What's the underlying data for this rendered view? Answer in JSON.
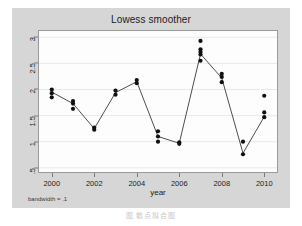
{
  "figure": {
    "note": "bandwidth = .1",
    "caption": "图          散点拟合图"
  },
  "chart_data": {
    "type": "scatter",
    "title": "Lowess smoother",
    "xlabel": "year",
    "ylabel": "",
    "xlim": [
      1999.4,
      2010.6
    ],
    "ylim": [
      0.42,
      3.12
    ],
    "grid": "horizontal",
    "legend": "none",
    "xticks": [
      2000,
      2002,
      2004,
      2006,
      2008,
      2010
    ],
    "xticklabels": [
      "2000",
      "2002",
      "2004",
      "2006",
      "2008",
      "2010"
    ],
    "yticks": [
      0.5,
      1,
      1.5,
      2,
      2.5,
      3
    ],
    "yticklabels": [
      ".5",
      "1",
      "1.5",
      "2",
      "2.5",
      "3"
    ],
    "marker": "filled-circle",
    "marker_color": "#101010",
    "line_color": "#3a3a3a",
    "plot_bg": "#fdfdfd",
    "figure_bg": "#d6d6d6",
    "points": [
      {
        "x": 2000,
        "y": 2.0
      },
      {
        "x": 2000,
        "y": 1.93
      },
      {
        "x": 2000,
        "y": 1.85
      },
      {
        "x": 2001,
        "y": 1.78
      },
      {
        "x": 2001,
        "y": 1.73
      },
      {
        "x": 2001,
        "y": 1.63
      },
      {
        "x": 2002,
        "y": 1.27
      },
      {
        "x": 2002,
        "y": 1.23
      },
      {
        "x": 2003,
        "y": 1.98
      },
      {
        "x": 2003,
        "y": 1.9
      },
      {
        "x": 2004,
        "y": 2.18
      },
      {
        "x": 2004,
        "y": 2.12
      },
      {
        "x": 2005,
        "y": 1.2
      },
      {
        "x": 2005,
        "y": 1.1
      },
      {
        "x": 2005,
        "y": 1.0
      },
      {
        "x": 2006,
        "y": 0.99
      },
      {
        "x": 2006,
        "y": 0.96
      },
      {
        "x": 2007,
        "y": 2.93
      },
      {
        "x": 2007,
        "y": 2.77
      },
      {
        "x": 2007,
        "y": 2.72
      },
      {
        "x": 2007,
        "y": 2.67
      },
      {
        "x": 2007,
        "y": 2.55
      },
      {
        "x": 2008,
        "y": 2.3
      },
      {
        "x": 2008,
        "y": 2.24
      },
      {
        "x": 2008,
        "y": 2.14
      },
      {
        "x": 2009,
        "y": 1.0
      },
      {
        "x": 2009,
        "y": 0.76
      },
      {
        "x": 2010,
        "y": 1.88
      },
      {
        "x": 2010,
        "y": 1.56
      },
      {
        "x": 2010,
        "y": 1.47
      }
    ],
    "smoother": {
      "name": "lowess",
      "bandwidth": 0.1,
      "x": [
        2000,
        2001,
        2002,
        2003,
        2004,
        2005,
        2006,
        2007,
        2008,
        2009,
        2010
      ],
      "y": [
        1.95,
        1.73,
        1.25,
        1.94,
        2.15,
        1.1,
        0.97,
        2.68,
        2.22,
        0.78,
        1.48
      ]
    }
  }
}
